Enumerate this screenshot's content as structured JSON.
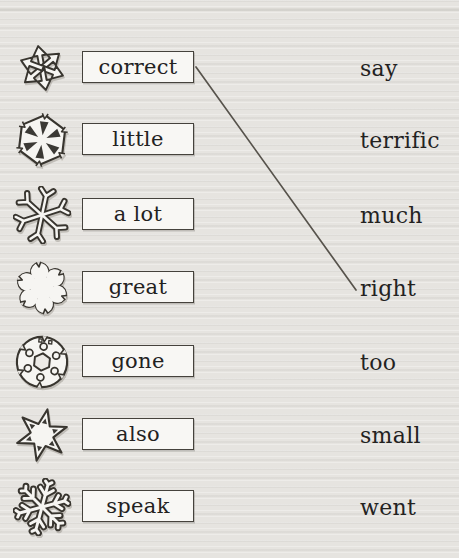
{
  "worksheet": {
    "type": "vocabulary-matching-exercise",
    "rows": [
      {
        "icon": "arrows-snowflake-icon",
        "word": "correct",
        "match": "say"
      },
      {
        "icon": "wedge-snowflake-icon",
        "word": "little",
        "match": "terrific"
      },
      {
        "icon": "spiky-snowflake-icon",
        "word": "a lot",
        "match": "much"
      },
      {
        "icon": "blob-snowflake-icon",
        "word": "great",
        "match": "right"
      },
      {
        "icon": "ring-snowflake-icon",
        "word": "gone",
        "match": "too"
      },
      {
        "icon": "star-snowflake-icon",
        "word": "also",
        "match": "small"
      },
      {
        "icon": "branch-snowflake-icon",
        "word": "speak",
        "match": "went"
      }
    ],
    "drawn_connection": {
      "from_word": "correct",
      "to_match": "right"
    }
  },
  "colors": {
    "paper": "#e6e4e0",
    "ink": "#23221f",
    "outline": "#38352f",
    "box_fill": "#f8f7f4",
    "box_border": "#45423c",
    "connector_line": "#57534c"
  }
}
